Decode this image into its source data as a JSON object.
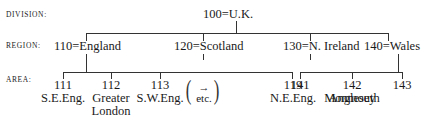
{
  "levels": {
    "division": "DIVISION:",
    "region": "REGION:",
    "area": "AREA:"
  },
  "root": {
    "code": "100",
    "name": "U.K.",
    "label": "100=U.K."
  },
  "regions": [
    {
      "code": "110",
      "name": "England",
      "label": "110=England"
    },
    {
      "code": "120",
      "name": "Scotland",
      "label": "120=Scotland"
    },
    {
      "code": "130",
      "name": "N. Ireland",
      "label": "130=N. Ireland"
    },
    {
      "code": "140",
      "name": "Wales",
      "label": "140=Wales"
    }
  ],
  "areas": [
    {
      "code": "111",
      "name": "S.E.Eng.",
      "parent": "110"
    },
    {
      "code": "112",
      "name": "Greater",
      "name2": "London",
      "parent": "110"
    },
    {
      "code": "113",
      "name": "S.W.Eng.",
      "parent": "110"
    },
    {
      "code": "119",
      "name": "N.E.Eng.",
      "parent": "110"
    },
    {
      "code": "141",
      "name": "Monmouth",
      "parent": "140"
    },
    {
      "code": "142",
      "name": "Anglesey",
      "parent": "140"
    },
    {
      "code": "143",
      "name": "",
      "parent": "140"
    }
  ],
  "etc_note": {
    "arrow": "→",
    "text": "etc."
  }
}
